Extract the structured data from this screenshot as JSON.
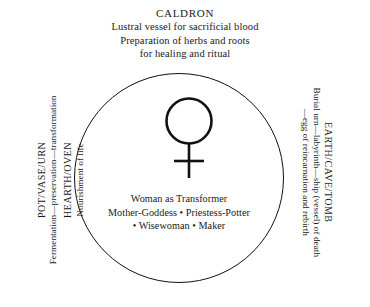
{
  "diagram": {
    "title": "CALDRON",
    "symbol_name": "venus-female-symbol",
    "top": {
      "heading": "CALDRON",
      "lines": [
        "Lustral vessel for sacrificial blood",
        "Preparation of herbs and roots",
        "for healing and ritual"
      ]
    },
    "center": {
      "lines": [
        "Woman as Transformer",
        "Mother-Goddess • Priestess-Potter",
        "• Wisewoman • Maker"
      ]
    },
    "left_axis": {
      "group_one_title": "POT/VASE/URN",
      "group_one_sub": "Fermentation—preservation—transformation",
      "group_two_title": "HEARTH/OVEN",
      "group_two_sub": "Nourishment of life"
    },
    "right_axis": {
      "title": "EARTH/CAVE/TOMB",
      "sub_line_one": "Burial urn—labyrinth—ship (vessel) of death",
      "sub_line_two": "—egg of reincarnation and rebirth"
    },
    "colors": {
      "ink": "#1a1a1a",
      "stroke": "#111111",
      "background": "#ffffff"
    }
  }
}
